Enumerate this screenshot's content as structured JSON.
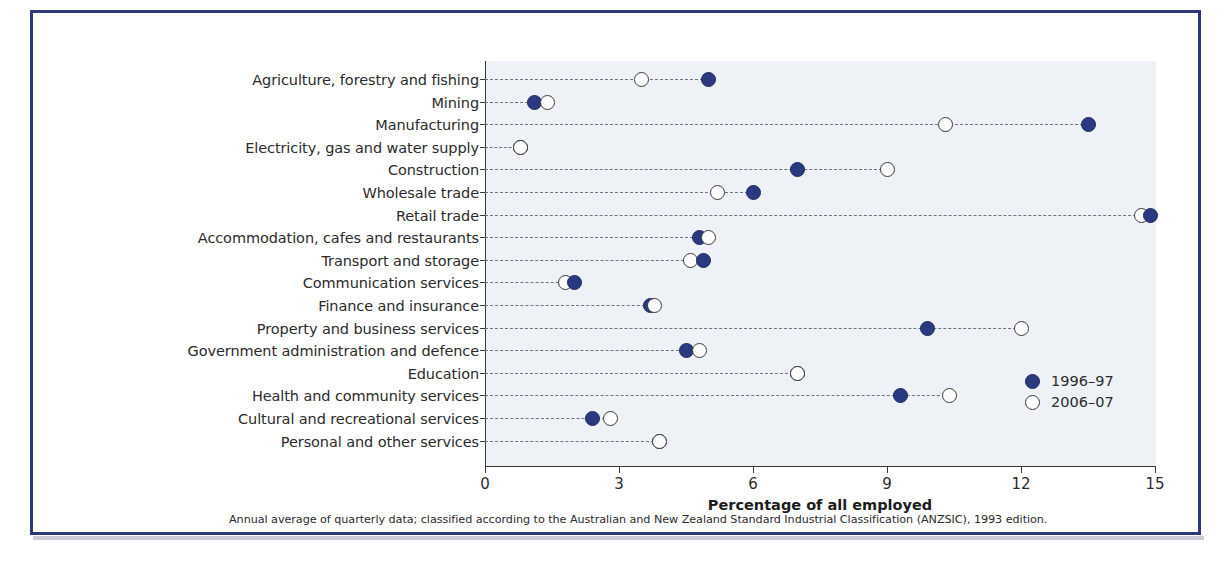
{
  "chart_data": {
    "type": "scatter",
    "title": "",
    "xlabel": "Percentage of all employed",
    "ylabel": "",
    "xlim": [
      0,
      15
    ],
    "xticks": [
      0,
      3,
      6,
      9,
      12,
      15
    ],
    "grid": false,
    "legend_position": "inside-right",
    "orientation": "horizontal",
    "categories": [
      "Agriculture, forestry and fishing",
      "Mining",
      "Manufacturing",
      "Electricity, gas and water supply",
      "Construction",
      "Wholesale trade",
      "Retail trade",
      "Accommodation, cafes and restaurants",
      "Transport and storage",
      "Communication services",
      "Finance and insurance",
      "Property and business services",
      "Government administration and defence",
      "Education",
      "Health and community services",
      "Cultural and recreational services",
      "Personal and other services"
    ],
    "series": [
      {
        "name": "1996–97",
        "marker": "filled-circle",
        "color": "#2b3a80",
        "values": [
          5.0,
          1.1,
          13.5,
          0.8,
          7.0,
          6.0,
          14.9,
          4.8,
          4.9,
          2.0,
          3.7,
          9.9,
          4.5,
          7.0,
          9.3,
          2.4,
          3.9
        ]
      },
      {
        "name": "2006–07",
        "marker": "open-circle",
        "color": "#ffffff",
        "values": [
          3.5,
          1.4,
          10.3,
          0.8,
          9.0,
          5.2,
          14.7,
          5.0,
          4.6,
          1.8,
          3.8,
          12.0,
          4.8,
          7.0,
          10.4,
          2.8,
          3.9
        ]
      }
    ]
  },
  "legend": {
    "items": [
      {
        "label": "1996–97",
        "marker": "filled-circle"
      },
      {
        "label": "2006–07",
        "marker": "open-circle"
      }
    ]
  },
  "axis": {
    "title": "Percentage of all employed",
    "ticklabels": [
      "0",
      "3",
      "6",
      "9",
      "12",
      "15"
    ]
  },
  "footnote": "Annual average of quarterly data; classified according to the Australian and New Zealand Standard Industrial Classification (ANZSIC), 1993 edition.",
  "colors": {
    "series_1996_97": "#2b3a80",
    "series_2006_07": "#ffffff",
    "frame": "#2e3a77",
    "panel_background": "#eef2f6",
    "axis": "#3a3a3a"
  }
}
